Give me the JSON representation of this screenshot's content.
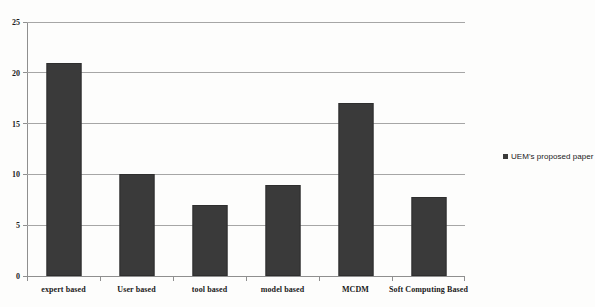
{
  "figure": {
    "background_color": "#fdfdfc",
    "bar_color": "#3a3a3a",
    "gridline_color": "#a6a6a6",
    "axis_color": "#8f8f8f",
    "top_crop_remnant": ""
  },
  "legend": {
    "position": "right",
    "marker": "filled-square",
    "entries": [
      {
        "label": "UEM's proposed paper",
        "color": "#3a3a3a"
      }
    ]
  },
  "chart_data": {
    "type": "bar",
    "title": "",
    "xlabel": "",
    "ylabel": "",
    "ylim": [
      0,
      25
    ],
    "yticks": [
      0,
      5,
      10,
      15,
      20,
      25
    ],
    "ytick_labels": [
      "0",
      "5",
      "10",
      "15",
      "20",
      "25"
    ],
    "grid": true,
    "grid_axis": "y",
    "legend_position": "right",
    "categories": [
      "expert based",
      "User based",
      "tool based",
      "model based",
      "MCDM",
      "Soft Computing Based"
    ],
    "series": [
      {
        "name": "UEM's proposed paper",
        "color": "#3a3a3a",
        "values": [
          21,
          10,
          7,
          9,
          17,
          7.8
        ]
      }
    ]
  }
}
